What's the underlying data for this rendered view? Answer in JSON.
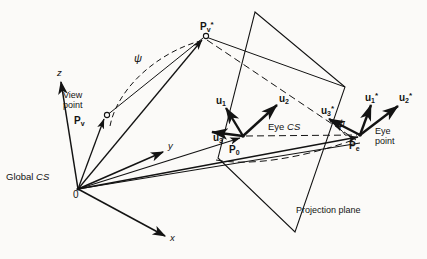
{
  "figure": {
    "background_color": "#fbfaf8",
    "ink_color": "#131313"
  },
  "axes": {
    "origin_label": "0",
    "z_label": "z",
    "y_label": "y",
    "x_label": "x"
  },
  "labels": {
    "global_cs": "Global CS",
    "global_cs_italic": "CS",
    "global_cs_plain": "Global ",
    "view_point_line1": "View",
    "view_point_line2": "point",
    "p_v": "P",
    "p_v_sub": "v",
    "p_v_star": "P",
    "p_v_star_sub": "v",
    "p_v_star_sup": "*",
    "eye_cs_plain": "Eye ",
    "eye_cs_italic": "CS",
    "p_0": "P",
    "p_0_sub": "0",
    "u1": "u",
    "u1_sub": "1",
    "u2": "u",
    "u2_sub": "2",
    "u3": "u",
    "u3_sub": "3",
    "u1_star": "u",
    "u1_star_sub": "1",
    "u1_star_sup": "*",
    "u2_star": "u",
    "u2_star_sub": "2",
    "u2_star_sup": "*",
    "u3_star": "u",
    "u3_star_sub": "3",
    "u3_star_sup": "*",
    "p_e": "P",
    "p_e_sub": "e",
    "eye_point_line1": "Eye",
    "eye_point_line2": "point",
    "psi_left": "ψ",
    "psi_right": "ψ",
    "projection_plane": "Projection plane"
  },
  "geometry": {
    "origin": [
      78,
      189
    ],
    "z_axis_tip": [
      61,
      80
    ],
    "y_axis_tip": [
      166,
      150
    ],
    "x_axis_tip": [
      168,
      238
    ],
    "view_point": [
      106,
      116
    ],
    "p_v_star": [
      205,
      37
    ],
    "p_0": [
      243,
      136
    ],
    "p_e": [
      362,
      135
    ],
    "plane_corners": [
      [
        255,
        12
      ],
      [
        345,
        87
      ],
      [
        295,
        232
      ],
      [
        218,
        158
      ]
    ]
  }
}
